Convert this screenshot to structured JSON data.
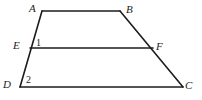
{
  "figure": {
    "background_color": "#ffffff",
    "stroke_color": "#1c1c1c",
    "stroke_width": 1.6,
    "width": 202,
    "height": 100,
    "vertices": [
      {
        "name": "A",
        "label": "A",
        "x": 42,
        "y": 11
      },
      {
        "name": "B",
        "label": "B",
        "x": 120,
        "y": 11
      },
      {
        "name": "E",
        "label": "E",
        "x": 30,
        "y": 48
      },
      {
        "name": "F",
        "label": "F",
        "x": 153,
        "y": 48
      },
      {
        "name": "D",
        "label": "D",
        "x": 20,
        "y": 87
      },
      {
        "name": "C",
        "label": "C",
        "x": 183,
        "y": 87
      }
    ],
    "segments": [
      {
        "name": "segment-AB",
        "from": "A",
        "to": "B",
        "x1": 42,
        "y1": 11,
        "x2": 120,
        "y2": 11
      },
      {
        "name": "segment-AD",
        "from": "A",
        "to": "D",
        "x1": 42,
        "y1": 11,
        "x2": 20,
        "y2": 87
      },
      {
        "name": "segment-BC",
        "from": "B",
        "to": "C",
        "x1": 120,
        "y1": 11,
        "x2": 183,
        "y2": 87
      },
      {
        "name": "segment-DC",
        "from": "D",
        "to": "C",
        "x1": 20,
        "y1": 87,
        "x2": 183,
        "y2": 87
      },
      {
        "name": "segment-EF",
        "from": "E",
        "to": "F",
        "x1": 30,
        "y1": 48,
        "x2": 153,
        "y2": 48
      }
    ],
    "angle_labels": [
      {
        "name": "angle-1",
        "label": "1",
        "at_vertex": "E",
        "x": 38,
        "y": 42
      },
      {
        "name": "angle-2",
        "label": "2",
        "at_vertex": "D",
        "x": 29,
        "y": 80
      }
    ]
  }
}
